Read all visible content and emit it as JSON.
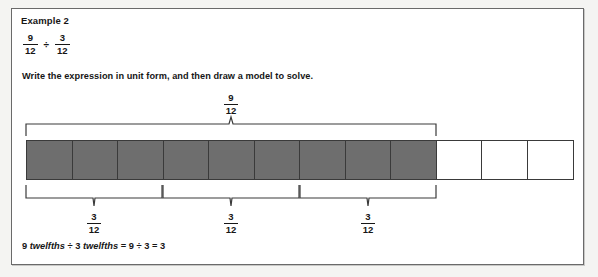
{
  "worksheet": {
    "heading": "Example 2",
    "expression": {
      "left_fraction": {
        "numerator": "9",
        "denominator": "12"
      },
      "operator": "÷",
      "right_fraction": {
        "numerator": "3",
        "denominator": "12"
      }
    },
    "instruction": "Write the expression in unit form, and then draw a model to solve.",
    "answer_line": {
      "text": "9 twelfths ÷ 3 twelfths = 9 ÷ 3 = 3",
      "part_1_count": "9",
      "part_1_unit": "twelfths",
      "operator_1": "÷",
      "part_2_count": "3",
      "part_2_unit": "twelfths",
      "equals_1": "=",
      "part_3": "9",
      "operator_2": "÷",
      "part_4": "3",
      "equals_2": "=",
      "result": "3"
    }
  },
  "model": {
    "total_cells": 12,
    "shaded_cells": 9,
    "top_brace_label": {
      "numerator": "9",
      "denominator": "12"
    },
    "bottom_brace_labels": [
      {
        "numerator": "3",
        "denominator": "12"
      },
      {
        "numerator": "3",
        "denominator": "12"
      },
      {
        "numerator": "3",
        "denominator": "12"
      }
    ],
    "colors": {
      "shaded_fill": "#6e6e6e",
      "cell_border": "#3a3a3a",
      "card_border": "#6a6a6a",
      "text": "#161616",
      "page_background": "#f4f4f2"
    }
  }
}
